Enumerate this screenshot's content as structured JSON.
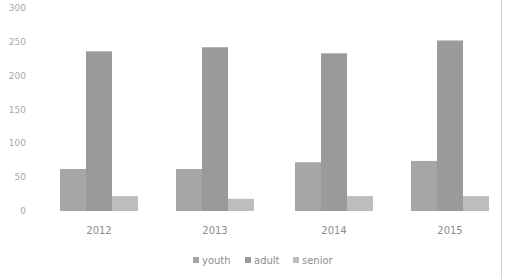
{
  "chart_data": {
    "type": "bar",
    "title": "",
    "xlabel": "",
    "ylabel": "",
    "categories": [
      "2012",
      "2013",
      "2014",
      "2015"
    ],
    "series": [
      {
        "name": "youth",
        "color": "#a6a6a6",
        "values": [
          62,
          62,
          72,
          74
        ]
      },
      {
        "name": "adult",
        "color": "#9a9a9a",
        "values": [
          236,
          242,
          233,
          252
        ]
      },
      {
        "name": "senior",
        "color": "#bdbdbd",
        "values": [
          22,
          18,
          22,
          22
        ]
      }
    ],
    "yticks": [
      0,
      50,
      100,
      150,
      200,
      250,
      300
    ],
    "ylim": [
      0,
      300
    ],
    "grid": false,
    "legend_position": "bottom"
  }
}
